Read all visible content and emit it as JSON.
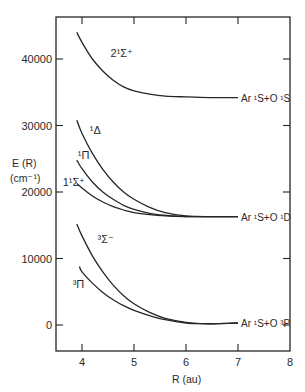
{
  "chart_data": {
    "type": "line",
    "title": "",
    "xlabel": "R (au)",
    "ylabel": "E (R)",
    "ylabel_units": "(cm⁻¹)",
    "xlim": [
      3.5,
      8
    ],
    "ylim": [
      -3800,
      46500
    ],
    "x_ticks": [
      4,
      5,
      6,
      7,
      8
    ],
    "y_ticks": [
      0,
      10000,
      20000,
      30000,
      40000
    ],
    "x_tick_labels": [
      "4",
      "5",
      "6",
      "7",
      "8"
    ],
    "y_tick_labels": [
      "0",
      "10000",
      "20000",
      "30000",
      "40000"
    ],
    "grid": false,
    "legend": "none (curves labeled inline)",
    "series": [
      {
        "name": "2¹Σ⁺",
        "label": "2¹Σ⁺",
        "asymptote": "Ar ¹S+O ¹S",
        "x": [
          3.9,
          4.0,
          4.2,
          4.4,
          4.6,
          4.8,
          5.0,
          5.3,
          5.6,
          6.0,
          6.5,
          7.0
        ],
        "y": [
          44000,
          42500,
          40000,
          38200,
          36800,
          35800,
          35200,
          34700,
          34400,
          34300,
          34200,
          34200
        ]
      },
      {
        "name": "¹Δ",
        "label": "¹Δ",
        "asymptote": "Ar ¹S+O ¹D",
        "x": [
          3.9,
          4.0,
          4.2,
          4.4,
          4.6,
          4.8,
          5.0,
          5.3,
          5.6,
          6.0,
          6.5,
          7.0
        ],
        "y": [
          30800,
          28800,
          25800,
          23400,
          21500,
          20000,
          18900,
          17700,
          16900,
          16400,
          16300,
          16300
        ]
      },
      {
        "name": "¹Π",
        "label": "¹Π",
        "asymptote": "Ar ¹S+O ¹D",
        "x": [
          3.9,
          4.0,
          4.2,
          4.4,
          4.6,
          4.8,
          5.0,
          5.3,
          5.6,
          6.0,
          6.5,
          7.0
        ],
        "y": [
          24800,
          23500,
          21500,
          20000,
          18900,
          18000,
          17400,
          16800,
          16500,
          16300,
          16300,
          16300
        ]
      },
      {
        "name": "1¹Σ⁺",
        "label": "1¹Σ⁺",
        "asymptote": "Ar ¹S+O ¹D",
        "x": [
          3.9,
          4.0,
          4.2,
          4.4,
          4.6,
          4.8,
          5.0,
          5.3,
          5.6,
          6.0,
          6.5,
          7.0
        ],
        "y": [
          21300,
          20600,
          19400,
          18500,
          17800,
          17300,
          16900,
          16600,
          16400,
          16300,
          16300,
          16300
        ]
      },
      {
        "name": "³Σ⁻",
        "label": "³Σ⁻",
        "asymptote": "Ar ¹S+O ³P",
        "x": [
          3.9,
          4.0,
          4.2,
          4.4,
          4.6,
          4.8,
          5.0,
          5.3,
          5.6,
          6.0,
          6.3,
          6.6,
          7.0
        ],
        "y": [
          15200,
          13400,
          10400,
          8000,
          6000,
          4400,
          3200,
          1900,
          1000,
          400,
          200,
          200,
          300
        ]
      },
      {
        "name": "³Π",
        "label": "³Π",
        "asymptote": "Ar ¹S+O ³P",
        "x": [
          3.95,
          4.0,
          4.2,
          4.4,
          4.6,
          4.8,
          5.0,
          5.3,
          5.6,
          6.0,
          6.3,
          6.6,
          7.0
        ],
        "y": [
          8800,
          8000,
          6300,
          4900,
          3800,
          2900,
          2200,
          1400,
          800,
          300,
          200,
          200,
          300
        ]
      }
    ],
    "annotations": [
      {
        "text": "2¹Σ⁺",
        "x": 4.55,
        "y": 40300
      },
      {
        "text": "¹Δ",
        "x": 4.15,
        "y": 28700
      },
      {
        "text": "¹Π",
        "x": 3.92,
        "y": 25000
      },
      {
        "text": "1¹Σ⁺",
        "x": 3.63,
        "y": 20900
      },
      {
        "text": "³Σ⁻",
        "x": 4.3,
        "y": 12400
      },
      {
        "text": "³Π",
        "x": 3.82,
        "y": 5600
      },
      {
        "text": "Ar ¹S+O ¹S",
        "x": 7.02,
        "y": 34200
      },
      {
        "text": "Ar ¹S+O ¹D",
        "x": 7.02,
        "y": 16300
      },
      {
        "text": "Ar ¹S+O ³P",
        "x": 7.02,
        "y": 300
      }
    ]
  },
  "labels": {
    "x_axis": "R (au)",
    "y_axis_line1": "E (R)",
    "y_axis_line2": "(cm⁻¹)",
    "asym_os": "Ar ¹S+O ¹S",
    "asym_od": "Ar ¹S+O ¹D",
    "asym_op": "Ar ¹S+O ³P",
    "state_2sigma": "2¹Σ⁺",
    "state_delta": "¹Δ",
    "state_1pi": "¹Π",
    "state_1sigma": "1¹Σ⁺",
    "state_3sigma": "³Σ⁻",
    "state_3pi": "³Π"
  }
}
